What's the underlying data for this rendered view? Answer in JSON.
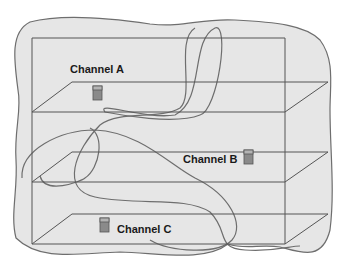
{
  "diagram": {
    "type": "layered-channels-with-coverage-blobs",
    "colors": {
      "background": "#ffffff",
      "blob_fill": "#e6e6e6",
      "blob_stroke": "#6e6e6e",
      "box_stroke": "#555555",
      "device_top": "#b3b3b3",
      "device_body": "#8a8a8a",
      "device_stroke": "#555555",
      "label_color": "#1a1a1a"
    },
    "channels": [
      {
        "id": "A",
        "label": "Channel A",
        "device_position": "left-center"
      },
      {
        "id": "B",
        "label": "Channel B",
        "device_position": "right"
      },
      {
        "id": "C",
        "label": "Channel C",
        "device_position": "left"
      }
    ]
  }
}
